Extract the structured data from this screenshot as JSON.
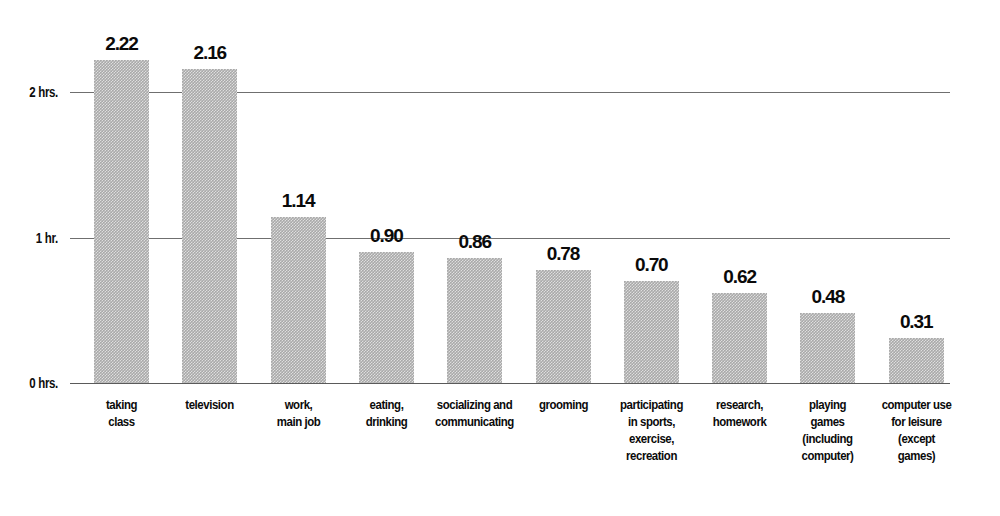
{
  "chart_data": {
    "type": "bar",
    "title": "",
    "subtitle": "",
    "xlabel": "",
    "ylabel": "",
    "ylim": [
      0,
      2.4
    ],
    "grid": true,
    "legend": null,
    "axis": {
      "y_ticks": [
        {
          "value": 0,
          "label": "0 hrs."
        },
        {
          "value": 1,
          "label": "1 hr."
        },
        {
          "value": 2,
          "label": "2 hrs."
        }
      ]
    },
    "categories": [
      "taking class",
      "television",
      "work, main job",
      "eating, drinking",
      "socializing and communicating",
      "grooming",
      "participating in sports, exercise, recreation",
      "research, homework",
      "playing games (including computer)",
      "computer use for leisure (except games)"
    ],
    "category_lines": [
      [
        "taking",
        "class"
      ],
      [
        "television"
      ],
      [
        "work,",
        "main job"
      ],
      [
        "eating,",
        "drinking"
      ],
      [
        "socializing and",
        "communicating"
      ],
      [
        "grooming"
      ],
      [
        "participating",
        "in sports,",
        "exercise,",
        "recreation"
      ],
      [
        "research,",
        "homework"
      ],
      [
        "playing",
        "games",
        "(including",
        "computer)"
      ],
      [
        "computer use",
        "for leisure",
        "(except",
        "games)"
      ]
    ],
    "values": [
      2.22,
      2.16,
      1.14,
      0.9,
      0.86,
      0.78,
      0.7,
      0.62,
      0.48,
      0.31
    ],
    "value_labels": [
      "2.22",
      "2.16",
      "1.14",
      "0.90",
      "0.86",
      "0.78",
      "0.70",
      "0.62",
      "0.48",
      "0.31"
    ],
    "colors": {
      "bar_fill": "#a9a9a9",
      "gridline": "#6f6f6f",
      "text": "#0a0a0a",
      "background": "#ffffff"
    }
  }
}
